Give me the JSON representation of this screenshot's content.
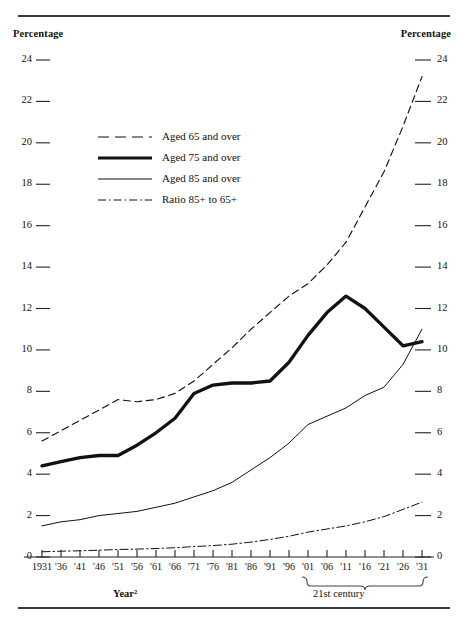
{
  "figure": {
    "axis_title_left": "Percentage",
    "axis_title_right": "Percentage",
    "xlabel": "Year²",
    "century_bracket_label": "21st century"
  },
  "legend": {
    "items": [
      {
        "label": "Aged 65 and over",
        "style": "dashed",
        "width": 1.1,
        "name": "aged-65-and-over"
      },
      {
        "label": "Aged 75 and over",
        "style": "solid",
        "width": 3.2,
        "name": "aged-75-and-over"
      },
      {
        "label": "Aged 85 and over",
        "style": "solid",
        "width": 1.0,
        "name": "aged-85-and-over"
      },
      {
        "label": "Ratio 85+ to 65+",
        "style": "dashdot",
        "width": 1.0,
        "name": "ratio-85-to-65"
      }
    ]
  },
  "chart_data": {
    "type": "line",
    "title": "",
    "xlabel": "Year²",
    "ylabel": "Percentage",
    "ylim": [
      0,
      24
    ],
    "ytick_step": 2,
    "yticks": [
      0,
      2,
      4,
      6,
      8,
      10,
      12,
      14,
      16,
      18,
      20,
      22,
      24
    ],
    "grid": false,
    "legend_position": "upper-left-inside",
    "x": [
      1931,
      1936,
      1941,
      1946,
      1951,
      1956,
      1961,
      1966,
      1971,
      1976,
      1981,
      1986,
      1991,
      1996,
      2001,
      2006,
      2011,
      2016,
      2021,
      2026,
      2031
    ],
    "xticklabels": [
      "1931",
      "'36",
      "'41",
      "'46",
      "'51",
      "'56",
      "'61",
      "'66",
      "'71",
      "'76",
      "'81",
      "'86",
      "'91",
      "'96",
      "'01",
      "'06",
      "'11",
      "'16",
      "'21",
      "'26",
      "'31"
    ],
    "annotations": [
      "21st century bracket spans '01 to '31"
    ],
    "series": [
      {
        "name": "Aged 65 and over",
        "style": "dashed",
        "values": [
          5.6,
          6.1,
          6.6,
          7.1,
          7.6,
          7.5,
          7.6,
          7.9,
          8.5,
          9.3,
          10.1,
          11.0,
          11.8,
          12.6,
          13.2,
          14.1,
          15.2,
          16.9,
          18.6,
          20.8,
          23.2
        ]
      },
      {
        "name": "Aged 75 and over",
        "style": "solid-thick",
        "values": [
          4.4,
          4.6,
          4.8,
          4.9,
          4.9,
          5.4,
          6.0,
          6.7,
          7.9,
          8.3,
          8.4,
          8.4,
          8.5,
          9.4,
          10.7,
          11.8,
          12.6,
          12.0,
          11.1,
          10.2,
          10.4
        ]
      },
      {
        "name": "Aged 85 and over",
        "style": "solid-thin",
        "values": [
          1.5,
          1.7,
          1.8,
          2.0,
          2.1,
          2.2,
          2.4,
          2.6,
          2.9,
          3.2,
          3.6,
          4.2,
          4.8,
          5.5,
          6.4,
          6.8,
          7.2,
          7.8,
          8.2,
          9.3,
          11.0
        ]
      },
      {
        "name": "Ratio 85+ to 65+",
        "style": "dashdot",
        "values": [
          0.25,
          0.28,
          0.3,
          0.33,
          0.36,
          0.38,
          0.41,
          0.45,
          0.5,
          0.55,
          0.62,
          0.72,
          0.85,
          1.0,
          1.2,
          1.35,
          1.5,
          1.7,
          1.95,
          2.3,
          2.65
        ]
      }
    ]
  }
}
